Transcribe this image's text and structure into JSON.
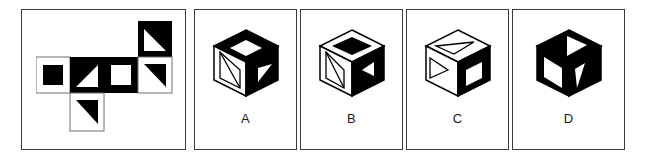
{
  "puzzle": {
    "type": "cube-folding-visual-reasoning",
    "prompt_panel": {
      "name": "unfolded-cube-net",
      "grid": {
        "rows": 3,
        "cols": 4
      },
      "cells": [
        {
          "row": 1,
          "col": 4,
          "background": "#000000",
          "figure": "white-triangle",
          "figure_color": "#ffffff",
          "description": "black square containing a white right triangle with the right angle at the bottom-right"
        },
        {
          "row": 2,
          "col": 1,
          "background": "#ffffff",
          "figure": "black-square",
          "figure_color": "#000000",
          "description": "white square containing a solid black square"
        },
        {
          "row": 2,
          "col": 2,
          "background": "#000000",
          "figure": "white-triangle",
          "figure_color": "#ffffff",
          "description": "black square containing a white right triangle with the right angle at the bottom-left"
        },
        {
          "row": 2,
          "col": 3,
          "background": "#000000",
          "figure": "white-square",
          "figure_color": "#ffffff",
          "description": "black square containing a white square"
        },
        {
          "row": 2,
          "col": 4,
          "background": "#ffffff",
          "figure": "black-triangle",
          "figure_color": "#000000",
          "description": "white square containing a black right triangle with the right angle at the top-right"
        },
        {
          "row": 3,
          "col": 2,
          "background": "#ffffff",
          "figure": "black-triangle",
          "figure_color": "#000000",
          "description": "white square containing a black right triangle with the right angle at the top-right"
        }
      ]
    },
    "options": [
      {
        "id": "A",
        "label": "A",
        "body_color": "#000000",
        "top_face": {
          "fill": "#000000",
          "figure": "white-diamond",
          "figure_fill": "#ffffff"
        },
        "left_face": {
          "fill": "#ffffff",
          "figure": "outline-triangle",
          "figure_fill": "#ffffff"
        },
        "right_face": {
          "fill": "#000000",
          "figure": "white-triangle",
          "figure_fill": "#ffffff"
        }
      },
      {
        "id": "B",
        "label": "B",
        "body_color": "#000000",
        "top_face": {
          "fill": "#ffffff",
          "figure": "black-diamond",
          "figure_fill": "#000000"
        },
        "left_face": {
          "fill": "#ffffff",
          "figure": "outline-triangle",
          "figure_fill": "#ffffff"
        },
        "right_face": {
          "fill": "#000000",
          "figure": "white-triangle",
          "figure_fill": "#ffffff"
        }
      },
      {
        "id": "C",
        "label": "C",
        "body_color": "#000000",
        "top_face": {
          "fill": "#ffffff",
          "figure": "outline-triangle",
          "figure_fill": "#ffffff"
        },
        "left_face": {
          "fill": "#ffffff",
          "figure": "outline-triangle",
          "figure_fill": "#ffffff"
        },
        "right_face": {
          "fill": "#000000",
          "figure": "white-square",
          "figure_fill": "#ffffff"
        }
      },
      {
        "id": "D",
        "label": "D",
        "body_color": "#000000",
        "top_face": {
          "fill": "#000000",
          "figure": "white-triangle",
          "figure_fill": "#ffffff"
        },
        "left_face": {
          "fill": "#000000",
          "figure": "white-square",
          "figure_fill": "#ffffff"
        },
        "right_face": {
          "fill": "#000000",
          "figure": "white-triangle",
          "figure_fill": "#ffffff"
        }
      }
    ],
    "colors": {
      "ink": "#000000",
      "paper": "#ffffff",
      "frame": "#3a3a3a",
      "label": "#1b1b1b"
    }
  }
}
